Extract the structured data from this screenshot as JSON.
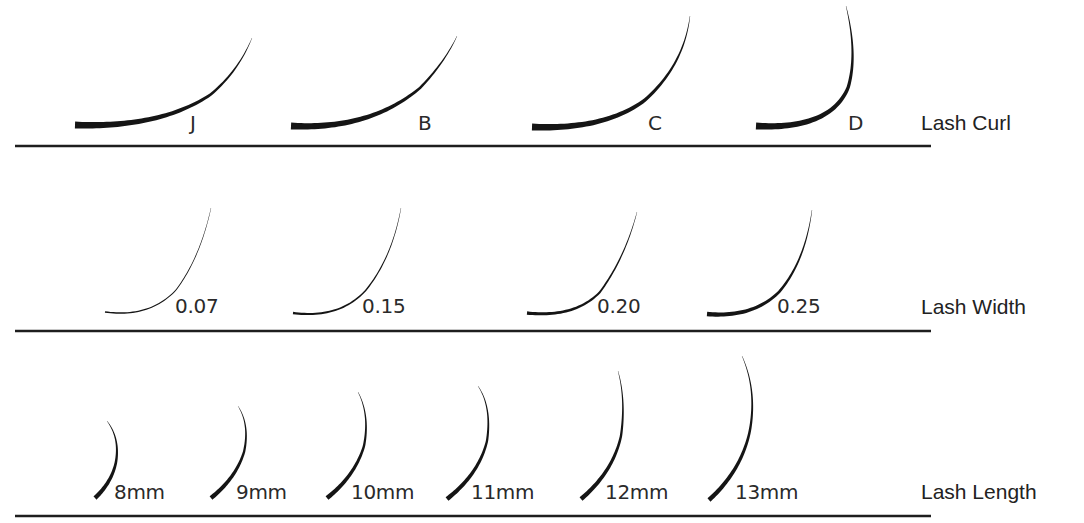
{
  "colors": {
    "background": "#ffffff",
    "ink": "#151515",
    "text": "#222222"
  },
  "rows": [
    {
      "id": "curl",
      "title": "Lash Curl",
      "baseline_y": 146,
      "items": [
        {
          "label": "J",
          "label_x": 190,
          "label_y": 130,
          "path": "M 75 125 Q 160 128 210 95 Q 238 72 252 38"
        },
        {
          "label": "B",
          "label_x": 418,
          "label_y": 130,
          "path": "M 291 126 Q 370 130 420 88 Q 445 62 457 36"
        },
        {
          "label": "C",
          "label_x": 648,
          "label_y": 130,
          "path": "M 532 127 Q 605 130 645 100 Q 684 65 690 16"
        },
        {
          "label": "D",
          "label_x": 848,
          "label_y": 130,
          "path": "M 756 126 Q 830 130 848 88 Q 858 55 846 6"
        }
      ]
    },
    {
      "id": "width",
      "title": "Lash Width",
      "baseline_y": 331,
      "items": [
        {
          "label": "0.07",
          "label_x": 175,
          "label_y": 313,
          "path": "M 105 312 Q 150 318 176 290 Q 200 258 211 208",
          "thickness": 1.2
        },
        {
          "label": "0.15",
          "label_x": 362,
          "label_y": 313,
          "path": "M 293 313 Q 340 319 366 290 Q 392 258 401 208",
          "thickness": 2.0
        },
        {
          "label": "0.20",
          "label_x": 597,
          "label_y": 313,
          "path": "M 527 313 Q 575 318 600 292 Q 625 258 637 212",
          "thickness": 3.0
        },
        {
          "label": "0.25",
          "label_x": 777,
          "label_y": 313,
          "path": "M 707 314 Q 753 318 779 292 Q 805 262 812 210",
          "thickness": 4.2
        }
      ]
    },
    {
      "id": "length",
      "title": "Lash Length",
      "baseline_y": 516,
      "items": [
        {
          "label": "8mm",
          "label_x": 114,
          "label_y": 499,
          "path": "M 95 498 Q 112 482 116 462 Q 120 438 107 421"
        },
        {
          "label": "9mm",
          "label_x": 236,
          "label_y": 499,
          "path": "M 211 498 Q 236 478 244 452 Q 250 425 238 406"
        },
        {
          "label": "10mm",
          "label_x": 351,
          "label_y": 499,
          "path": "M 327 498 Q 355 476 364 446 Q 370 415 358 392"
        },
        {
          "label": "11mm",
          "label_x": 471,
          "label_y": 499,
          "path": "M 447 499 Q 479 474 487 441 Q 492 407 478 386"
        },
        {
          "label": "12mm",
          "label_x": 605,
          "label_y": 499,
          "path": "M 581 499 Q 613 472 621 436 Q 626 400 618 371"
        },
        {
          "label": "13mm",
          "label_x": 735,
          "label_y": 499,
          "path": "M 709 500 Q 742 470 750 430 Q 757 390 742 356"
        }
      ]
    }
  ],
  "chart_data": {
    "type": "diagram",
    "categories": [
      {
        "name": "Lash Curl",
        "values": [
          "J",
          "B",
          "C",
          "D"
        ]
      },
      {
        "name": "Lash Width",
        "values": [
          "0.07",
          "0.15",
          "0.20",
          "0.25"
        ]
      },
      {
        "name": "Lash Length",
        "values": [
          "8mm",
          "9mm",
          "10mm",
          "11mm",
          "12mm",
          "13mm"
        ]
      }
    ]
  }
}
